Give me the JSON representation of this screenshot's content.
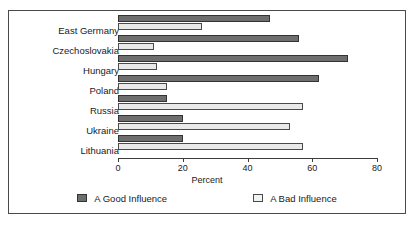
{
  "chart_data": {
    "type": "bar",
    "orientation": "horizontal",
    "title": "",
    "xlabel": "Percent",
    "ylabel": "",
    "xlim": [
      0,
      80
    ],
    "xticks": [
      0,
      20,
      40,
      60,
      80
    ],
    "grid": false,
    "legend_position": "bottom",
    "categories": [
      "East Germany",
      "Czechoslovakia",
      "Hungary",
      "Poland",
      "Russia",
      "Ukraine",
      "Lithuania"
    ],
    "series": [
      {
        "name": "A Good Influence",
        "color": "#6e6e6e",
        "values": [
          47,
          56,
          71,
          62,
          15,
          20,
          20
        ]
      },
      {
        "name": "A Bad Influence",
        "color": "#e9e9e9",
        "values": [
          26,
          11,
          12,
          15,
          57,
          53,
          57
        ]
      }
    ]
  },
  "axis": {
    "tick_labels": [
      "0",
      "20",
      "40",
      "60",
      "80"
    ],
    "x_title": "Percent"
  },
  "legend": {
    "items": [
      {
        "label": "A Good Influence",
        "swatch": "good"
      },
      {
        "label": "A Bad Influence",
        "swatch": "bad"
      }
    ]
  }
}
